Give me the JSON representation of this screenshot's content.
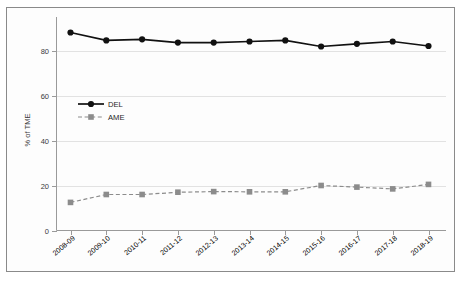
{
  "chart_data": {
    "type": "line",
    "title": "",
    "xlabel": "",
    "ylabel": "% of TME",
    "ylim": [
      0,
      90
    ],
    "yticks": [
      0,
      20,
      40,
      60,
      80
    ],
    "grid": true,
    "legend_position": "inside-upper-left",
    "categories": [
      "2008-09",
      "2009-10",
      "2010-11",
      "2011-12",
      "2012-13",
      "2013-14",
      "2014-15",
      "2015-16",
      "2016-17",
      "2017-18",
      "2018-19"
    ],
    "series": [
      {
        "name": "DEL",
        "color": "#111111",
        "linestyle": "solid",
        "marker": "circle",
        "values": [
          88.0,
          84.5,
          85.0,
          83.5,
          83.5,
          84.0,
          84.5,
          81.8,
          83.0,
          84.0,
          82.0
        ]
      },
      {
        "name": "AME",
        "color": "#8c8c8c",
        "linestyle": "dashed",
        "marker": "square",
        "values": [
          12.5,
          16.0,
          16.0,
          17.0,
          17.3,
          17.2,
          17.2,
          20.0,
          19.3,
          18.5,
          20.5
        ]
      }
    ]
  },
  "legend": {
    "entries": [
      {
        "label": "DEL"
      },
      {
        "label": "AME"
      }
    ]
  },
  "axis": {
    "y_title": "% of TME",
    "y_tick_labels": [
      "0",
      "20",
      "40",
      "60",
      "80"
    ],
    "x_tick_labels": [
      "2008-09",
      "2009-10",
      "2010-11",
      "2011-12",
      "2012-13",
      "2013-14",
      "2014-15",
      "2015-16",
      "2016-17",
      "2017-18",
      "2018-19"
    ]
  },
  "colors": {
    "del": "#111111",
    "ame": "#8c8c8c",
    "grid": "#e2e2e2",
    "axis": "#9a9a9a",
    "frame": "#8a8a8a"
  }
}
